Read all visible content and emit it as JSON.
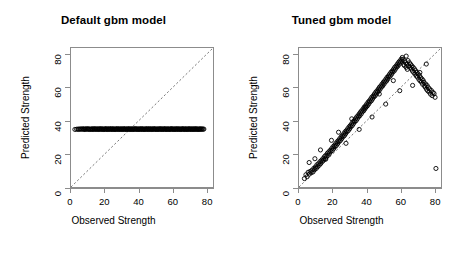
{
  "figure": {
    "background": "#ffffff",
    "point_color": "#000000",
    "axis_color": "#8c8c8c",
    "refline_color": "#555555"
  },
  "chart_data": [
    {
      "type": "scatter",
      "panel": "left",
      "title": "Default gbm model",
      "xlabel": "Observed Strength",
      "ylabel": "Predicted Strength",
      "xlim": [
        0,
        84
      ],
      "ylim": [
        0,
        84
      ],
      "xticks": [
        0,
        20,
        40,
        60,
        80
      ],
      "yticks": [
        0,
        20,
        40,
        60,
        80
      ],
      "xticklabels": [
        "0",
        "20",
        "40",
        "60",
        "80"
      ],
      "yticklabels": [
        "0",
        "20",
        "40",
        "60",
        "80"
      ],
      "grid": false,
      "legend": "none",
      "marker": "open-circle",
      "annotations": [
        {
          "kind": "reference-line",
          "style": "dashed",
          "slope": 1,
          "intercept": 0
        }
      ],
      "description": "Predictions collapse to a nearly constant value near 35 across all observed strengths.",
      "x": [
        2.3,
        3.3,
        4.1,
        4.6,
        5.2,
        5.8,
        6.3,
        6.9,
        7.4,
        7.8,
        8.2,
        8.6,
        9.0,
        9.5,
        9.9,
        10.3,
        10.7,
        11.1,
        11.6,
        12.0,
        12.4,
        12.8,
        13.1,
        13.5,
        13.9,
        14.3,
        14.6,
        15.0,
        15.4,
        15.8,
        16.1,
        16.5,
        16.9,
        17.2,
        17.6,
        18.0,
        18.3,
        18.7,
        19.0,
        19.4,
        19.8,
        20.1,
        20.5,
        20.8,
        21.2,
        21.5,
        21.9,
        22.2,
        22.6,
        22.9,
        23.3,
        23.6,
        24.0,
        24.3,
        24.7,
        25.0,
        25.4,
        25.7,
        26.1,
        26.4,
        26.8,
        27.1,
        27.5,
        27.8,
        28.2,
        28.5,
        28.9,
        29.2,
        29.6,
        29.9,
        30.3,
        30.6,
        31.0,
        31.3,
        31.7,
        32.0,
        32.4,
        32.7,
        33.1,
        33.4,
        33.8,
        34.1,
        34.5,
        34.8,
        35.2,
        35.5,
        35.9,
        36.2,
        36.6,
        36.9,
        37.3,
        37.6,
        38.0,
        38.3,
        38.7,
        39.0,
        39.4,
        39.7,
        40.1,
        40.4,
        40.8,
        41.1,
        41.5,
        41.8,
        42.2,
        42.5,
        42.9,
        43.2,
        43.6,
        43.9,
        44.3,
        44.6,
        45.0,
        45.3,
        45.7,
        46.0,
        46.4,
        46.7,
        47.1,
        47.4,
        47.8,
        48.1,
        48.5,
        48.8,
        49.2,
        49.5,
        49.9,
        50.2,
        50.6,
        50.9,
        51.3,
        51.6,
        52.0,
        52.3,
        52.7,
        53.0,
        53.4,
        53.7,
        54.1,
        54.4,
        54.8,
        55.1,
        55.5,
        55.8,
        56.2,
        56.5,
        56.9,
        57.2,
        57.6,
        57.9,
        58.3,
        58.6,
        59.0,
        59.3,
        59.7,
        60.0,
        60.4,
        60.7,
        61.1,
        61.4,
        61.8,
        62.1,
        62.5,
        62.8,
        63.2,
        63.5,
        63.9,
        64.2,
        64.6,
        64.9,
        65.3,
        65.6,
        66.0,
        66.3,
        66.7,
        67.0,
        67.4,
        67.7,
        68.1,
        68.4,
        68.8,
        69.1,
        69.5,
        69.8,
        70.2,
        70.5,
        70.9,
        71.2,
        71.6,
        71.9,
        72.3,
        72.6,
        73.0,
        73.3,
        73.7,
        74.0,
        74.4,
        74.7,
        75.1,
        75.4,
        75.8,
        76.1,
        76.5,
        76.8,
        77.2,
        77.6,
        78.1,
        78.6,
        79.2,
        79.8,
        80.4
      ],
      "y": [
        34.8,
        34.9,
        35.0,
        34.8,
        35.1,
        35.0,
        34.9,
        35.2,
        35.0,
        34.8,
        35.1,
        34.9,
        35.0,
        35.2,
        34.9,
        35.0,
        35.1,
        34.8,
        35.0,
        34.9,
        35.1,
        35.0,
        34.8,
        35.2,
        35.0,
        34.9,
        35.1,
        35.0,
        34.9,
        35.0,
        35.1,
        34.8,
        35.0,
        35.2,
        34.9,
        35.0,
        35.1,
        34.9,
        35.0,
        34.8,
        35.1,
        35.0,
        34.9,
        35.2,
        35.0,
        34.8,
        35.1,
        34.9,
        35.0,
        35.1,
        34.9,
        35.0,
        35.2,
        34.8,
        35.0,
        35.1,
        34.9,
        35.0,
        34.8,
        35.1,
        35.0,
        34.9,
        35.2,
        35.0,
        34.8,
        35.1,
        34.9,
        35.0,
        35.1,
        34.9,
        35.0,
        34.8,
        35.2,
        35.0,
        34.9,
        35.1,
        35.0,
        34.8,
        35.0,
        35.1,
        34.9,
        35.0,
        35.2,
        34.8,
        35.0,
        34.9,
        35.1,
        35.0,
        34.8,
        35.1,
        34.9,
        35.0,
        35.2,
        34.9,
        35.0,
        35.1,
        34.8,
        35.0,
        34.9,
        35.1,
        35.0,
        34.8,
        35.2,
        35.0,
        34.9,
        35.0,
        35.1,
        34.8,
        35.0,
        34.9,
        35.1,
        35.0,
        34.9,
        35.2,
        34.8,
        35.0,
        35.1,
        34.9,
        35.0,
        35.1,
        34.8,
        35.0,
        34.9,
        35.2,
        35.0,
        34.9,
        35.1,
        35.0,
        34.8,
        35.0,
        34.9,
        35.1,
        35.0,
        34.8,
        35.2,
        35.0,
        34.9,
        35.1,
        34.8,
        35.0,
        35.1,
        34.9,
        35.0,
        35.2,
        34.8,
        35.0,
        34.9,
        35.1,
        35.0,
        34.9,
        35.0,
        34.8,
        35.1,
        35.2,
        34.9,
        35.0,
        35.1,
        34.8,
        35.0,
        34.9,
        35.1,
        35.0,
        34.8,
        35.2,
        35.0,
        34.9,
        35.1,
        34.9,
        35.0,
        34.8,
        35.1,
        35.0,
        34.9,
        35.2,
        35.0,
        34.8,
        35.1,
        34.9,
        35.0,
        35.1,
        34.8,
        35.0,
        34.9,
        35.2,
        35.0,
        34.9,
        35.1,
        34.8,
        35.0,
        35.1,
        34.9,
        35.0,
        34.8,
        35.2,
        35.0,
        34.9,
        35.1,
        35.0,
        34.8,
        35.0,
        34.9,
        35.1,
        35.0,
        34.9,
        35.0,
        35.1,
        34.9,
        35.0
      ]
    },
    {
      "type": "scatter",
      "panel": "right",
      "title": "Tuned gbm model",
      "xlabel": "Observed Strength",
      "ylabel": "Predicted Strength",
      "xlim": [
        0,
        84
      ],
      "ylim": [
        0,
        84
      ],
      "xticks": [
        0,
        20,
        40,
        60,
        80
      ],
      "yticks": [
        0,
        20,
        40,
        60,
        80
      ],
      "xticklabels": [
        "0",
        "20",
        "40",
        "60",
        "80"
      ],
      "yticklabels": [
        "0",
        "20",
        "40",
        "60",
        "80"
      ],
      "grid": false,
      "legend": "none",
      "marker": "open-circle",
      "annotations": [
        {
          "kind": "reference-line",
          "style": "dashed",
          "slope": 1,
          "intercept": 0
        }
      ],
      "description": "Predictions track the 45-degree line closely with moderate scatter across the full range.",
      "x": [
        3.2,
        4.1,
        4.8,
        5.4,
        6.1,
        6.6,
        7.2,
        7.7,
        8.3,
        8.8,
        9.2,
        9.7,
        10.2,
        10.6,
        11.1,
        11.5,
        12.0,
        12.4,
        12.9,
        13.3,
        13.8,
        14.2,
        14.6,
        15.1,
        15.5,
        15.9,
        16.3,
        16.8,
        17.2,
        17.6,
        18.0,
        18.4,
        18.8,
        19.3,
        19.7,
        20.1,
        20.5,
        20.9,
        21.3,
        21.7,
        22.1,
        22.5,
        22.9,
        23.3,
        23.7,
        24.1,
        24.5,
        24.9,
        25.3,
        25.7,
        26.1,
        26.5,
        26.9,
        27.2,
        27.6,
        28.0,
        28.4,
        28.8,
        29.2,
        29.6,
        30.0,
        30.3,
        30.7,
        31.1,
        31.5,
        31.9,
        32.2,
        32.6,
        33.0,
        33.4,
        33.8,
        34.1,
        34.5,
        34.9,
        35.3,
        35.6,
        36.0,
        36.4,
        36.8,
        37.1,
        37.5,
        37.9,
        38.3,
        38.6,
        39.0,
        39.4,
        39.8,
        40.1,
        40.5,
        40.9,
        41.3,
        41.6,
        42.0,
        42.4,
        42.8,
        43.1,
        43.5,
        43.9,
        44.3,
        44.6,
        45.0,
        45.4,
        45.8,
        46.1,
        46.5,
        46.9,
        47.3,
        47.6,
        48.0,
        48.4,
        48.8,
        49.1,
        49.5,
        49.9,
        50.3,
        50.6,
        51.0,
        51.4,
        51.8,
        52.1,
        52.5,
        52.9,
        53.3,
        53.6,
        54.0,
        54.4,
        54.8,
        55.1,
        55.5,
        55.9,
        56.3,
        56.6,
        57.0,
        57.4,
        57.8,
        58.1,
        58.5,
        58.9,
        59.3,
        59.6,
        60.0,
        60.4,
        60.8,
        61.1,
        61.5,
        61.9,
        62.3,
        62.6,
        63.0,
        63.4,
        63.8,
        64.1,
        64.5,
        64.9,
        65.3,
        65.6,
        66.0,
        66.4,
        66.8,
        67.1,
        67.5,
        67.9,
        68.3,
        68.6,
        69.0,
        69.4,
        69.8,
        70.1,
        70.5,
        70.9,
        71.3,
        71.6,
        72.0,
        72.4,
        72.8,
        73.1,
        73.5,
        73.9,
        74.3,
        74.6,
        75.0,
        75.4,
        75.8,
        76.1,
        76.5,
        76.9,
        77.3,
        77.8,
        78.3,
        78.8,
        79.3,
        79.9,
        80.5,
        81.0,
        6.0,
        9.4,
        12.7,
        15.8,
        19.2,
        23.4,
        27.8,
        31.2,
        35.6,
        39.4,
        43.2,
        47.5,
        51.3,
        55.8,
        59.6,
        63.4,
        67.2,
        71.5,
        75.3,
        79.1
      ],
      "y": [
        5.1,
        7.4,
        6.2,
        8.9,
        7.8,
        9.4,
        8.6,
        10.2,
        9.1,
        11.3,
        10.4,
        12.1,
        11.2,
        13.4,
        12.3,
        14.1,
        13.2,
        15.3,
        14.2,
        16.1,
        15.4,
        17.2,
        16.3,
        18.4,
        17.1,
        19.2,
        18.3,
        20.4,
        19.1,
        21.2,
        20.3,
        22.1,
        21.4,
        23.2,
        22.1,
        24.3,
        23.2,
        25.1,
        24.4,
        26.2,
        25.1,
        27.3,
        26.2,
        28.1,
        27.4,
        29.2,
        28.1,
        30.3,
        29.2,
        31.1,
        30.4,
        32.2,
        31.1,
        33.3,
        32.2,
        34.1,
        33.4,
        35.2,
        34.1,
        36.3,
        35.2,
        37.1,
        36.4,
        38.2,
        37.1,
        39.3,
        38.2,
        40.1,
        39.4,
        41.2,
        40.1,
        42.3,
        41.2,
        43.1,
        42.4,
        44.2,
        43.1,
        45.3,
        44.2,
        46.1,
        45.4,
        47.2,
        46.1,
        48.3,
        47.2,
        49.1,
        48.4,
        50.2,
        49.1,
        51.3,
        50.2,
        52.1,
        51.4,
        53.2,
        52.1,
        54.3,
        53.2,
        55.1,
        54.4,
        56.2,
        55.1,
        57.3,
        56.2,
        58.1,
        57.4,
        59.2,
        58.1,
        60.3,
        59.2,
        61.1,
        60.4,
        62.2,
        61.1,
        63.3,
        62.2,
        64.1,
        63.4,
        65.2,
        64.1,
        66.3,
        65.2,
        67.1,
        66.4,
        68.2,
        67.1,
        69.3,
        68.2,
        70.1,
        69.4,
        71.2,
        70.1,
        72.3,
        71.2,
        73.1,
        72.4,
        74.2,
        73.1,
        75.3,
        74.2,
        76.1,
        75.4,
        77.2,
        76.1,
        78.3,
        77.2,
        74.1,
        73.4,
        76.2,
        75.1,
        72.3,
        74.2,
        71.1,
        76.4,
        73.2,
        75.1,
        72.3,
        74.2,
        71.4,
        73.2,
        70.1,
        72.3,
        69.2,
        71.4,
        68.2,
        70.3,
        67.1,
        69.2,
        66.4,
        68.2,
        65.1,
        67.3,
        64.2,
        66.1,
        63.4,
        65.2,
        62.1,
        64.3,
        63.2,
        61.1,
        60.4,
        62.2,
        59.1,
        61.3,
        58.2,
        60.1,
        57.4,
        59.2,
        56.1,
        58.3,
        55.2,
        57.1,
        56.4,
        54.2,
        11.2,
        14.8,
        17.1,
        22.4,
        16.8,
        28.2,
        33.1,
        26.4,
        41.2,
        34.8,
        48.1,
        42.3,
        56.2,
        50.1,
        64.3,
        58.2,
        79.1,
        61.4,
        69.2,
        74.3
      ]
    }
  ]
}
